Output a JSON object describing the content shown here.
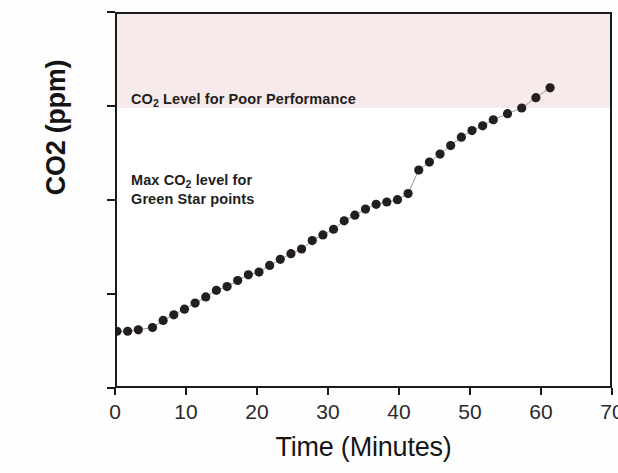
{
  "chart_data": {
    "type": "scatter",
    "title": "",
    "xlabel": "Time (Minutes)",
    "ylabel": "CO2 (ppm)",
    "xlim": [
      0,
      70
    ],
    "ylim": [
      400,
      1200
    ],
    "xticks": [
      0,
      10,
      20,
      30,
      40,
      50,
      60,
      70
    ],
    "yticks": [
      400,
      600,
      800,
      1000,
      1200
    ],
    "grid": false,
    "legend": null,
    "series": [
      {
        "name": "CO2 concentration",
        "marker": "filled-circle",
        "color": "#231f20",
        "line_color": "#9a9a9a",
        "x": [
          0,
          1.5,
          3,
          5,
          6.5,
          8,
          9.5,
          11,
          12.5,
          14,
          15.5,
          17,
          18.5,
          20,
          21.5,
          23,
          24.5,
          26,
          27.5,
          29,
          30.5,
          32,
          33.5,
          35,
          36.5,
          38,
          39.5,
          41,
          42.5,
          44,
          45.5,
          47,
          48.5,
          50,
          51.5,
          53,
          55,
          57,
          59,
          61
        ],
        "y": [
          525,
          525,
          528,
          533,
          548,
          560,
          572,
          585,
          598,
          612,
          620,
          633,
          645,
          651,
          665,
          678,
          690,
          700,
          718,
          730,
          742,
          760,
          772,
          785,
          795,
          800,
          805,
          818,
          868,
          885,
          902,
          920,
          938,
          952,
          962,
          975,
          988,
          1000,
          1022,
          1043
        ]
      }
    ],
    "shaded_region": {
      "label": "poor-performance-band",
      "from": 1000,
      "to": 1200,
      "color": "#f7eaea"
    },
    "annotations": [
      {
        "id": "poor-performance",
        "text": "CO2 Level for Poor Performance",
        "text_prefix": "CO",
        "text_sub": "2",
        "text_suffix": " Level for Poor Performance",
        "x": 3,
        "y": 1065
      },
      {
        "id": "green-star",
        "text": "Max CO2 level for\nGreen Star points",
        "line1_prefix": "Max CO",
        "line1_sub": "2",
        "line1_suffix": " level for",
        "line2": "Green Star points",
        "x": 3,
        "y": 900
      }
    ]
  },
  "figure": {
    "background_color": "#ffffff",
    "frame_color": "#1a1a1a",
    "marker_color": "#231f20"
  }
}
